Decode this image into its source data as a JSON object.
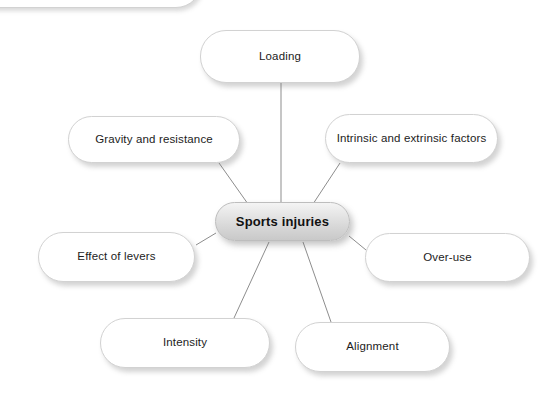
{
  "diagram": {
    "type": "spider-map",
    "title": "Sports injuries",
    "center": {
      "label": "Sports injuries",
      "x": 215,
      "y": 202,
      "width": 135,
      "height": 39
    },
    "background_color": "#ffffff",
    "node_fill_color": "#ffffff",
    "node_border_color": "#d2d2d2",
    "center_fill_color": "#dcdcdc",
    "connector_color": "#8d8d8d",
    "text_color": "#1c1c1c",
    "branches": [
      {
        "label": "Loading",
        "x": 200,
        "y": 30,
        "width": 160,
        "height": 53,
        "line": {
          "x1": 281,
          "y1": 83,
          "x2": 281,
          "y2": 203
        }
      },
      {
        "label": "Intrinsic and extrinsic factors",
        "x": 325,
        "y": 114,
        "width": 173,
        "height": 49,
        "line": {
          "x1": 340,
          "y1": 163,
          "x2": 313,
          "y2": 204
        }
      },
      {
        "label": "Over-use",
        "x": 365,
        "y": 233,
        "width": 165,
        "height": 49,
        "line": {
          "x1": 366,
          "y1": 250,
          "x2": 349,
          "y2": 236
        }
      },
      {
        "label": "Alignment",
        "x": 295,
        "y": 322,
        "width": 155,
        "height": 50,
        "line": {
          "x1": 331,
          "y1": 322,
          "x2": 303,
          "y2": 242
        }
      },
      {
        "label": "Intensity",
        "x": 100,
        "y": 318,
        "width": 170,
        "height": 50,
        "line": {
          "x1": 234,
          "y1": 318,
          "x2": 269,
          "y2": 242
        }
      },
      {
        "label": "Effect of levers",
        "x": 38,
        "y": 232,
        "width": 157,
        "height": 50,
        "line": {
          "x1": 196,
          "y1": 245,
          "x2": 216,
          "y2": 233
        }
      },
      {
        "label": "Gravity and resistance",
        "x": 68,
        "y": 116,
        "width": 172,
        "height": 47,
        "line": {
          "x1": 219,
          "y1": 163,
          "x2": 248,
          "y2": 204
        }
      }
    ],
    "partial_shape": {
      "x": -60,
      "y": -46,
      "width": 262,
      "height": 54
    }
  }
}
